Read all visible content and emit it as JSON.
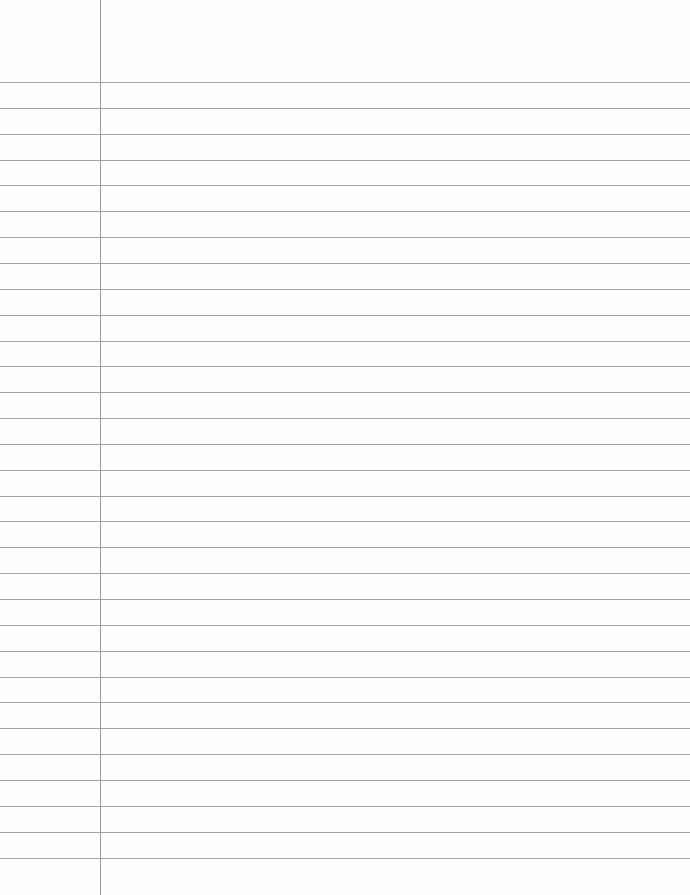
{
  "page": {
    "type": "ruled-notebook-paper",
    "ruled_line_count": 31,
    "has_margin_line": true,
    "text_lines": [],
    "colors": {
      "paper": "#fdfdfd",
      "rule": "#a4a4a4",
      "margin": "#9a9a9a"
    }
  }
}
